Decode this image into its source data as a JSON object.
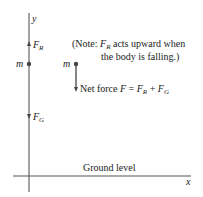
{
  "diagram": {
    "axes": {
      "x_label": "x",
      "y_label": "y"
    },
    "mass_label": "m",
    "forces": {
      "resistance": {
        "symbol": "F",
        "subscript": "R",
        "direction": "up"
      },
      "gravity": {
        "symbol": "F",
        "subscript": "G",
        "direction": "down"
      }
    },
    "net_force": {
      "prefix": "Net force ",
      "F": "F",
      "eq": " = ",
      "FR": "F",
      "FR_sub": "R",
      "plus": " + ",
      "FG": "F",
      "FG_sub": "G"
    },
    "note": {
      "line1_prefix": "(Note: ",
      "line1_symbol": "F",
      "line1_sub": "R",
      "line1_suffix": " acts upward when",
      "line2": "the body is falling.)"
    },
    "ground_label": "Ground level",
    "colors": {
      "line": "#555555",
      "text": "#222222"
    }
  }
}
